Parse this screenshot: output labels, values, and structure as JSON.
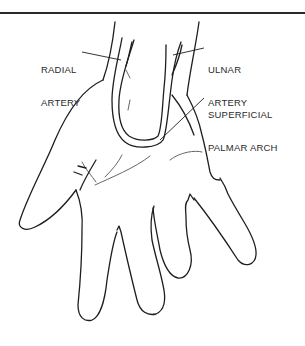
{
  "diagram": {
    "labels": [
      {
        "id": "radial-artery",
        "lines": [
          "RADIAL",
          "ARTERY"
        ]
      },
      {
        "id": "ulnar-artery",
        "lines": [
          "ULNAR",
          "ARTERY"
        ]
      },
      {
        "id": "superficial-palmar-arch",
        "lines": [
          "SUPERFICIAL",
          "PALMAR ARCH"
        ]
      }
    ]
  },
  "colors": {
    "line": "#1e1e1e",
    "background": "#ffffff",
    "rule": "#2a2a2a"
  }
}
